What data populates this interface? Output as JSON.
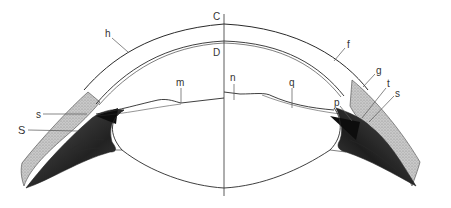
{
  "figure": {
    "type": "anatomical-cross-section",
    "axis_label_top": "C",
    "axis_label_inner": "D",
    "labels": [
      {
        "id": "h",
        "text": "h",
        "x": 107,
        "y": 37,
        "target": [
          128,
          52
        ]
      },
      {
        "id": "C",
        "text": "C",
        "x": 214,
        "y": 20,
        "target": [
          224,
          24
        ]
      },
      {
        "id": "D",
        "text": "D",
        "x": 214,
        "y": 55,
        "target": [
          224,
          42
        ]
      },
      {
        "id": "m",
        "text": "m",
        "x": 177,
        "y": 86,
        "target": [
          181,
          103
        ]
      },
      {
        "id": "n",
        "text": "n",
        "x": 231,
        "y": 80,
        "target": [
          236,
          96
        ]
      },
      {
        "id": "q",
        "text": "q",
        "x": 290,
        "y": 86,
        "target": [
          293,
          108
        ]
      },
      {
        "id": "f",
        "text": "f",
        "x": 347,
        "y": 48,
        "target": [
          334,
          61
        ]
      },
      {
        "id": "g",
        "text": "g",
        "x": 377,
        "y": 74,
        "target": [
          363,
          87
        ]
      },
      {
        "id": "t",
        "text": "t",
        "x": 388,
        "y": 87,
        "target": [
          362,
          118
        ]
      },
      {
        "id": "s_right",
        "text": "s",
        "x": 395,
        "y": 96,
        "target": [
          369,
          122
        ]
      },
      {
        "id": "p",
        "text": "p",
        "x": 336,
        "y": 105,
        "target": [
          352,
          121
        ]
      },
      {
        "id": "s_left",
        "text": "s",
        "x": 36,
        "y": 117,
        "target": [
          87,
          115
        ]
      },
      {
        "id": "S",
        "text": "S",
        "x": 20,
        "y": 133,
        "target": [
          78,
          131
        ]
      }
    ]
  },
  "colors": {
    "background": "#ffffff",
    "line": "#2a2a2a",
    "label": "#333333",
    "sclera_shade": "#b8b8b8",
    "ciliary_dark": "#1a1a1a"
  }
}
